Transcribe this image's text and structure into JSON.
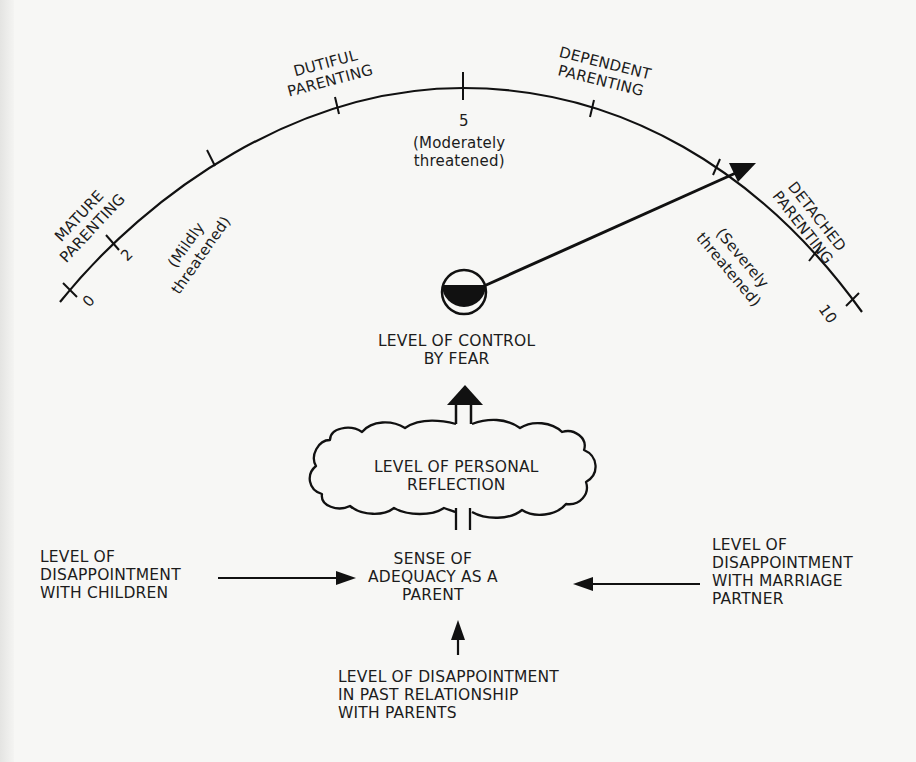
{
  "gauge": {
    "scale_labels": {
      "zero": "0",
      "two": "2",
      "five": "5",
      "ten": "10"
    },
    "zone_labels": {
      "mature": "MATURE\nPARENTING",
      "dutiful": "DUTIFUL\nPARENTING",
      "dependent": "DEPENDENT\nPARENTING",
      "detached": "DETACHED\nPARENTING"
    },
    "threat_labels": {
      "mild": "(Mildly\nthreatened)",
      "moderate": "(Moderately\nthreatened)",
      "severe": "(Severely\nthreatened)"
    },
    "needle_value_approx": 8.5
  },
  "nodes": {
    "control_by_fear": "LEVEL OF CONTROL\nBY FEAR",
    "personal_reflection": "LEVEL OF PERSONAL\nREFLECTION",
    "sense_of_adequacy": "SENSE OF\nADEQUACY AS A\nPARENT",
    "disappointment_children": "LEVEL OF\nDISAPPOINTMENT\nWITH CHILDREN",
    "disappointment_partner": "LEVEL OF\nDISAPPOINTMENT\nWITH MARRIAGE\nPARTNER",
    "disappointment_parents": "LEVEL OF DISAPPOINTMENT\nIN PAST RELATIONSHIP\nWITH PARENTS"
  },
  "colors": {
    "ink": "#111111",
    "paper": "#f7f7f5"
  }
}
